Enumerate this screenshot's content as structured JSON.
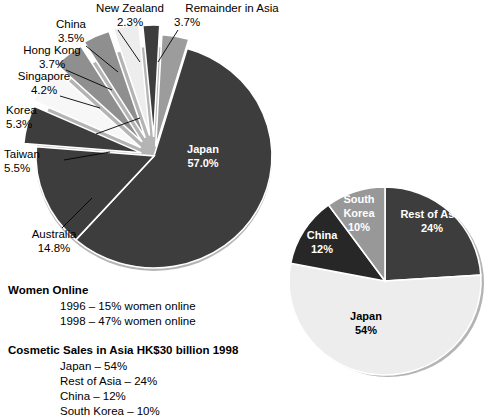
{
  "chart_data": [
    {
      "type": "pie",
      "id": "internet-users-asia-pacific",
      "title": "",
      "categories": [
        "Japan",
        "Australia",
        "Taiwan",
        "Korea",
        "Singapore",
        "Hong Kong",
        "China",
        "New Zealand",
        "Remainder in Asia"
      ],
      "values": [
        57.0,
        14.8,
        5.5,
        5.3,
        4.2,
        3.7,
        3.5,
        2.3,
        3.7
      ],
      "value_labels": [
        "57.0%",
        "14.8%",
        "5.5%",
        "5.3%",
        "4.2%",
        "3.7%",
        "3.7%",
        "3.5%",
        "2.3%"
      ],
      "colors": [
        "#3d3d3d",
        "#3d3d3d",
        "#3d3d3d",
        "#f2f2f2",
        "#8f8f8f",
        "#8f8f8f",
        "#e8e8e8",
        "#3d3d3d",
        "#9c9c9c"
      ],
      "legend_position": "callout-labels",
      "grid": false,
      "slices": [
        {
          "name": "Japan",
          "percent": 57.0,
          "label": "Japan",
          "value_label": "57.0%",
          "color": "#3d3d3d",
          "label_placement": "inside",
          "text_color": "#ffffff"
        },
        {
          "name": "Australia",
          "percent": 14.8,
          "label": "Australia",
          "value_label": "14.8%",
          "color": "#3d3d3d",
          "label_placement": "outside",
          "text_color": "#000000"
        },
        {
          "name": "Taiwan",
          "percent": 5.5,
          "label": "Taiwan",
          "value_label": "5.5%",
          "color": "#3d3d3d",
          "label_placement": "outside",
          "text_color": "#000000"
        },
        {
          "name": "Korea",
          "percent": 5.3,
          "label": "Korea",
          "value_label": "5.3%",
          "color": "#f7f7f7",
          "label_placement": "outside",
          "text_color": "#000000"
        },
        {
          "name": "Singapore",
          "percent": 4.2,
          "label": "Singapore",
          "value_label": "4.2%",
          "color": "#8f8f8f",
          "label_placement": "outside",
          "text_color": "#000000"
        },
        {
          "name": "Hong Kong",
          "percent": 3.7,
          "label": "Hong Kong",
          "value_label": "3.7%",
          "color": "#8f8f8f",
          "label_placement": "outside",
          "text_color": "#000000"
        },
        {
          "name": "China",
          "percent": 3.5,
          "label": "China",
          "value_label": "3.5%",
          "color": "#ededed",
          "label_placement": "outside",
          "text_color": "#000000"
        },
        {
          "name": "New Zealand",
          "percent": 2.3,
          "label": "New Zealand",
          "value_label": "2.3%",
          "color": "#3d3d3d",
          "label_placement": "outside",
          "text_color": "#000000"
        },
        {
          "name": "Remainder in Asia",
          "percent": 3.7,
          "label": "Remainder in Asia",
          "value_label": "3.7%",
          "color": "#9c9c9c",
          "label_placement": "outside",
          "text_color": "#000000"
        }
      ]
    },
    {
      "type": "pie",
      "id": "cosmetic-sales-asia-1998",
      "title": "",
      "categories": [
        "Japan",
        "Rest of Asia",
        "China",
        "South Korea"
      ],
      "values": [
        54,
        24,
        12,
        10
      ],
      "value_labels": [
        "54%",
        "24%",
        "12%",
        "10%"
      ],
      "colors": [
        "#ededed",
        "#3d3d3d",
        "#272727",
        "#989898"
      ],
      "legend_position": "inside-slices",
      "grid": false,
      "slices": [
        {
          "name": "Japan",
          "percent": 54,
          "label": "Japan",
          "value_label": "54%",
          "color": "#ededed",
          "text_color": "#000000"
        },
        {
          "name": "Rest of Asia",
          "percent": 24,
          "label": "Rest of Asia",
          "value_label": "24%",
          "color": "#3d3d3d",
          "text_color": "#ffffff"
        },
        {
          "name": "South Korea",
          "percent": 10,
          "label": "South Korea",
          "value_label": "10%",
          "color": "#989898",
          "text_color": "#ffffff"
        },
        {
          "name": "China",
          "percent": 12,
          "label": "China",
          "value_label": "12%",
          "color": "#272727",
          "text_color": "#ffffff"
        }
      ]
    }
  ],
  "pie1_labels": {
    "new_zealand": {
      "name": "New Zealand",
      "value": "2.3%"
    },
    "china": {
      "name": "China",
      "value": "3.5%"
    },
    "remainder": {
      "name": "Remainder in Asia",
      "value": "3.7%"
    },
    "hong_kong": {
      "name": "Hong Kong",
      "value": "3.7%"
    },
    "singapore": {
      "name": "Singapore",
      "value": "4.2%"
    },
    "korea": {
      "name": "Korea",
      "value": "5.3%"
    },
    "taiwan": {
      "name": "Taiwan",
      "value": "5.5%"
    },
    "australia": {
      "name": "Australia",
      "value": "14.8%"
    },
    "japan": {
      "name": "Japan",
      "value": "57.0%"
    }
  },
  "pie2_labels": {
    "south_korea": {
      "name": "South",
      "name2": "Korea",
      "value": "10%"
    },
    "china": {
      "name": "China",
      "value": "12%"
    },
    "rest_of_asia": {
      "name": "Rest of Asia",
      "value": "24%"
    },
    "japan": {
      "name": "Japan",
      "value": "54%"
    }
  },
  "notes": {
    "block1": {
      "heading": "Women Online",
      "items": [
        "1996 – 15% women online",
        "1998 – 47% women online"
      ]
    },
    "block2": {
      "heading": "Cosmetic Sales in Asia HK$30 billion 1998",
      "items": [
        "Japan – 54%",
        "Rest of Asia – 24%",
        "China – 12%",
        "South Korea – 10%"
      ]
    }
  }
}
